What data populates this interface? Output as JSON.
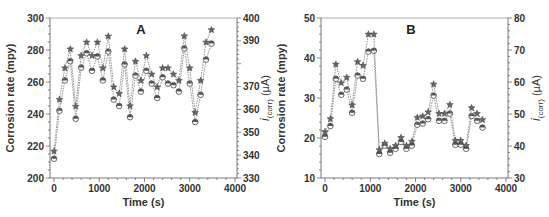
{
  "chart_data": [
    {
      "type": "line",
      "panel_label": "A",
      "title": "",
      "xlabel": "Time (s)",
      "ylabel": "Corrosion rate (mpy)",
      "y2label_main": "i",
      "y2label_sub": "(corr)",
      "y2label_unit": " (µA)",
      "xlim": [
        0,
        4000
      ],
      "ylim": [
        200,
        300
      ],
      "y2lim": [
        330,
        400
      ],
      "xticks": [
        "0",
        "1000",
        "2000",
        "3000",
        "4000"
      ],
      "xtick_values": [
        0,
        1000,
        2000,
        3000,
        4000
      ],
      "yticks": [
        "200",
        "220",
        "240",
        "260",
        "280",
        "300"
      ],
      "ytick_values": [
        200,
        220,
        240,
        260,
        280,
        300
      ],
      "y2ticks": [
        "330",
        "340",
        "350",
        "360",
        "370",
        "390",
        "400"
      ],
      "y2tick_values": [
        330,
        340,
        350,
        360,
        370,
        390,
        400
      ],
      "grid": false,
      "x": [
        0,
        120,
        240,
        360,
        480,
        600,
        720,
        840,
        960,
        1080,
        1200,
        1320,
        1440,
        1560,
        1680,
        1800,
        1920,
        2040,
        2160,
        2280,
        2400,
        2520,
        2640,
        2760,
        2880,
        3000,
        3120,
        3240,
        3360,
        3480
      ],
      "series": [
        {
          "name": "Corrosion rate",
          "axis": "left",
          "marker": "circle",
          "values": [
            212,
            242,
            261,
            273,
            237,
            269,
            278,
            267,
            276,
            261,
            279,
            249,
            245,
            271,
            238,
            264,
            254,
            267,
            259,
            250,
            263,
            259,
            258,
            254,
            281,
            259,
            235,
            252,
            274,
            284
          ]
        },
        {
          "name": "i(corr)",
          "axis": "right",
          "marker": "star",
          "values": [
            341.7,
            364.3,
            378.1,
            386.4,
            361.3,
            383.5,
            389.4,
            383.5,
            389.4,
            378.1,
            392.0,
            369.8,
            366.9,
            386.4,
            361.5,
            381.0,
            372.6,
            383.5,
            375.4,
            369.8,
            378.1,
            378.1,
            375.4,
            372.6,
            392.1,
            378.1,
            358.6,
            372.6,
            389.4,
            394.8
          ]
        }
      ]
    },
    {
      "type": "line",
      "panel_label": "B",
      "title": "",
      "xlabel": "Time (s)",
      "ylabel": "Corrosion rate (mpy)",
      "y2label_main": "i",
      "y2label_sub": "(corr)",
      "y2label_unit": " (µA)",
      "xlim": [
        0,
        4000
      ],
      "ylim": [
        10,
        50
      ],
      "y2lim": [
        30,
        80
      ],
      "xticks": [
        "0",
        "1000",
        "2000",
        "3000",
        "4000"
      ],
      "xtick_values": [
        0,
        1000,
        2000,
        3000,
        4000
      ],
      "yticks": [
        "10",
        "20",
        "30",
        "40",
        "50"
      ],
      "ytick_values": [
        10,
        20,
        30,
        40,
        50
      ],
      "y2ticks": [
        "30",
        "40",
        "50",
        "60",
        "70",
        "80"
      ],
      "y2tick_values": [
        30,
        40,
        50,
        60,
        70,
        80
      ],
      "grid": false,
      "x": [
        0,
        120,
        240,
        360,
        480,
        600,
        720,
        840,
        960,
        1080,
        1200,
        1320,
        1440,
        1560,
        1680,
        1800,
        1920,
        2040,
        2160,
        2280,
        2400,
        2520,
        2640,
        2760,
        2880,
        3000,
        3120,
        3240,
        3360,
        3480
      ],
      "series": [
        {
          "name": "Corrosion rate",
          "axis": "left",
          "marker": "circle",
          "values": [
            20.3,
            23.0,
            34.8,
            30.8,
            32.1,
            26.3,
            35.6,
            34.8,
            41.6,
            41.8,
            16.0,
            18.1,
            16.3,
            17.3,
            19.0,
            17.3,
            18.1,
            23.3,
            23.6,
            24.7,
            30.6,
            24.3,
            24.3,
            26.1,
            18.3,
            18.3,
            17.3,
            25.5,
            24.3,
            22.6
          ]
        },
        {
          "name": "i(corr)",
          "axis": "right",
          "marker": "star",
          "values": [
            44.4,
            48.5,
            65.5,
            59.7,
            61.4,
            52.8,
            66.3,
            65.1,
            74.9,
            74.9,
            38.8,
            40.8,
            39.1,
            40.1,
            42.6,
            40.1,
            41.4,
            48.9,
            49.3,
            50.6,
            59.3,
            50.1,
            50.1,
            52.9,
            41.7,
            41.7,
            40.1,
            51.9,
            50.1,
            48.2
          ]
        }
      ]
    }
  ]
}
